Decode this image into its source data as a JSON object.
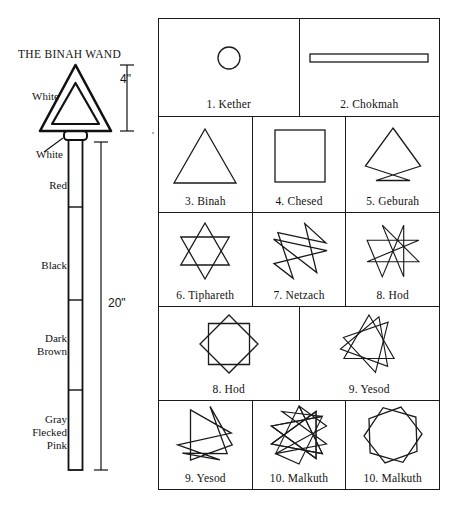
{
  "wand": {
    "title": "THE BINAH WAND",
    "labels": {
      "white_top": "White",
      "white_collar": "White",
      "red": "Red",
      "black": "Black",
      "dark_brown_line1": "Dark",
      "dark_brown_line2": "Brown",
      "gray_line1": "Gray",
      "gray_line2": "Flecked",
      "gray_line3": "Pink"
    },
    "dimensions": {
      "head_height": "4\"",
      "shaft_length": "20\""
    }
  },
  "grid": {
    "rows": [
      {
        "cells": [
          {
            "label": "1.  Kether",
            "shape": "circle"
          },
          {
            "label": "2.  Chokmah",
            "shape": "line-bar"
          }
        ]
      },
      {
        "cells": [
          {
            "label": "3.  Binah",
            "shape": "triangle"
          },
          {
            "label": "4.  Chesed",
            "shape": "square"
          },
          {
            "label": "5.  Geburah",
            "shape": "pentagram"
          }
        ]
      },
      {
        "cells": [
          {
            "label": "6.  Tiphareth",
            "shape": "hexagram"
          },
          {
            "label": "7.  Netzach",
            "shape": "heptagram-7-2"
          },
          {
            "label": "8.  Hod",
            "shape": "octagram-8-3"
          }
        ]
      },
      {
        "cells": [
          {
            "label": "8.  Hod",
            "shape": "octagram-8-2"
          },
          {
            "label": "9.  Yesod",
            "shape": "enneagram-9-3"
          }
        ]
      },
      {
        "cells": [
          {
            "label": "9.  Yesod",
            "shape": "enneagram-9-2"
          },
          {
            "label": "10.  Malkuth",
            "shape": "decagram-10-3"
          },
          {
            "label": "10.  Malkuth",
            "shape": "decagram-10-2"
          }
        ]
      }
    ]
  },
  "colors": {
    "ink": "#1a1a1a",
    "background": "#ffffff"
  }
}
